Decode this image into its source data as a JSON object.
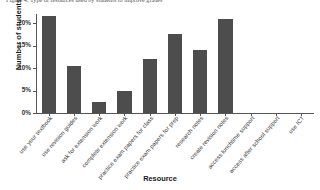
{
  "chart_data": {
    "type": "bar",
    "title": "Figure 4: Type of resources used by students to improve grades",
    "xlabel": "Resource",
    "ylabel": "Number of students",
    "categories": [
      "use your textbook",
      "use revision guides",
      "ask for extension work",
      "complete extension work",
      "practice exam papers for class",
      "practice exam papers for prep",
      "research notes",
      "create revision notes",
      "access lunchtime support",
      "access after school support",
      "use ICT"
    ],
    "values": [
      21.5,
      10.5,
      2.5,
      5.0,
      12.0,
      17.5,
      14.0,
      21.0,
      0,
      0,
      0
    ],
    "ylim": [
      0,
      22
    ],
    "yticks": [
      "0%",
      "5%",
      "10%",
      "15%",
      "20%"
    ],
    "ytick_values": [
      0,
      5,
      10,
      15,
      20
    ],
    "grid": false,
    "legend": "none",
    "bar_color": "#4d4d4d",
    "axis_color": "#555555"
  }
}
